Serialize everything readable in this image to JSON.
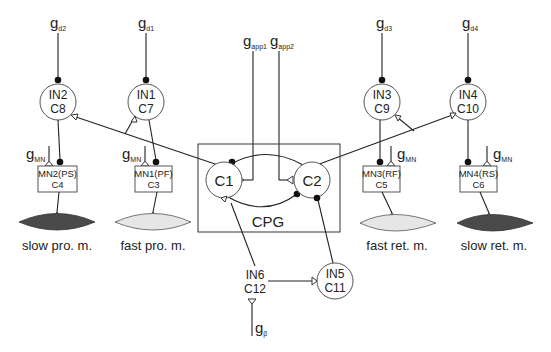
{
  "diagram": {
    "cpg": {
      "label": "CPG",
      "cells": [
        {
          "id": "c1",
          "label": "C1"
        },
        {
          "id": "c2",
          "label": "C2"
        }
      ]
    },
    "interneurons": [
      {
        "id": "in2",
        "line1": "IN2",
        "line2": "C8"
      },
      {
        "id": "in1",
        "line1": "IN1",
        "line2": "C7"
      },
      {
        "id": "in3",
        "line1": "IN3",
        "line2": "C9"
      },
      {
        "id": "in4",
        "line1": "IN4",
        "line2": "C10"
      },
      {
        "id": "in5",
        "line1": "IN5",
        "line2": "C11"
      },
      {
        "id": "in6",
        "line1": "IN6",
        "line2": "C12"
      }
    ],
    "motoneurons": [
      {
        "id": "mn2",
        "line1": "MN2(PS)",
        "line2": "C4"
      },
      {
        "id": "mn1",
        "line1": "MN1(PF)",
        "line2": "C3"
      },
      {
        "id": "mn3",
        "line1": "MN3(RF)",
        "line2": "C5"
      },
      {
        "id": "mn4",
        "line1": "MN4(RS)",
        "line2": "C6"
      }
    ],
    "muscles": [
      {
        "id": "slow-pro",
        "label": "slow pro. m.",
        "fill": "#4a4a4a"
      },
      {
        "id": "fast-pro",
        "label": "fast pro. m.",
        "fill": "#e6e6e6"
      },
      {
        "id": "fast-ret",
        "label": "fast ret. m.",
        "fill": "#e6e6e6"
      },
      {
        "id": "slow-ret",
        "label": "slow ret. m.",
        "fill": "#4a4a4a"
      }
    ],
    "inputs": {
      "gd2": {
        "base": "g",
        "sub": "d2"
      },
      "gd1": {
        "base": "g",
        "sub": "d1"
      },
      "gd3": {
        "base": "g",
        "sub": "d3"
      },
      "gd4": {
        "base": "g",
        "sub": "d4"
      },
      "gapp1": {
        "base": "g",
        "sub": "app1"
      },
      "gapp2": {
        "base": "g",
        "sub": "app2"
      },
      "gmn": {
        "base": "g",
        "sub": "MN"
      },
      "gbeta": {
        "base": "g",
        "sub": "β"
      }
    },
    "legend_semantics": {
      "filled_dot": "inhibitory synapse",
      "open_triangle": "excitatory synapse"
    }
  }
}
